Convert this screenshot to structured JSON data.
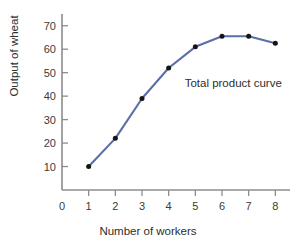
{
  "chart_data": {
    "type": "line",
    "title": "",
    "xlabel": "Number of workers",
    "ylabel": "Output of wheat",
    "x": [
      1,
      2,
      3,
      4,
      5,
      6,
      7,
      8
    ],
    "values": [
      10,
      22,
      39,
      52,
      61,
      65.5,
      65.5,
      62.5
    ],
    "series": [
      {
        "name": "Total product curve",
        "values": [
          10,
          22,
          39,
          52,
          61,
          65.5,
          65.5,
          62.5
        ]
      }
    ],
    "annotations": [
      {
        "text": "Total product curve",
        "x": 4.6,
        "y": 45
      }
    ],
    "xlim": [
      0,
      8.55
    ],
    "ylim": [
      0,
      75
    ],
    "xticks": [
      0,
      1,
      2,
      3,
      4,
      5,
      6,
      7,
      8
    ],
    "xtick_labels": [
      "0",
      "1",
      "2",
      "3",
      "4",
      "5",
      "6",
      "7",
      "8"
    ],
    "yticks": [
      10,
      20,
      30,
      40,
      50,
      60,
      70
    ],
    "ytick_labels": [
      "10",
      "20",
      "30",
      "40",
      "50",
      "60",
      "70"
    ],
    "grid": false,
    "legend": "none",
    "line_color": "#5a6ea8",
    "marker_color": "#151515",
    "axis_color": "#8c8c8c",
    "text_color": "#2e2e2e",
    "background": "#ffffff"
  }
}
